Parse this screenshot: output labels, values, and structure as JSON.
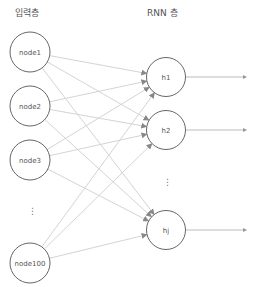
{
  "headers": {
    "input_layer": "입력층",
    "rnn_layer": "RNN 층"
  },
  "input_nodes": [
    {
      "label": "node1",
      "cx": 30,
      "cy": 52
    },
    {
      "label": "node2",
      "cx": 30,
      "cy": 106
    },
    {
      "label": "node3",
      "cx": 30,
      "cy": 160
    },
    {
      "label": "node100",
      "cx": 30,
      "cy": 263
    }
  ],
  "input_ellipsis": "⋮",
  "hidden_nodes": [
    {
      "label": "h1",
      "cx": 166,
      "cy": 77
    },
    {
      "label": "h2",
      "cx": 166,
      "cy": 130
    },
    {
      "label": "hj",
      "cx": 166,
      "cy": 230
    }
  ],
  "hidden_ellipsis": "⋮",
  "colors": {
    "node_stroke": "#666666",
    "edge": "#d4d4d4",
    "arrow": "#888888",
    "output_edge": "#bbbbbb"
  }
}
